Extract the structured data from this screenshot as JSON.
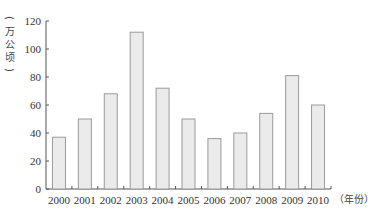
{
  "chart_data": {
    "type": "bar",
    "title": "",
    "xlabel": "（年份）",
    "ylabel": "（万公顷）",
    "categories": [
      "2000",
      "2001",
      "2002",
      "2003",
      "2004",
      "2005",
      "2006",
      "2007",
      "2008",
      "2009",
      "2010"
    ],
    "values": [
      37,
      50,
      68,
      112,
      72,
      50,
      36,
      40,
      54,
      81,
      60
    ],
    "ylim": [
      0,
      120
    ],
    "yticks": [
      0,
      20,
      40,
      60,
      80,
      100,
      120
    ],
    "grid": false,
    "legend": "none",
    "colors": {
      "bar_fill": "#ebebeb",
      "bar_stroke": "#9a9a9a",
      "axis": "#555555"
    }
  }
}
